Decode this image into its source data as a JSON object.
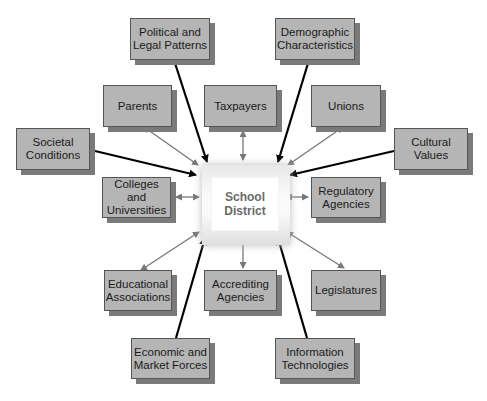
{
  "center": {
    "label_line1": "School",
    "label_line2": "District"
  },
  "nodes": [
    {
      "id": "political",
      "line1": "Political and",
      "line2": "Legal Patterns",
      "link": "one-way"
    },
    {
      "id": "demographic",
      "line1": "Demographic",
      "line2": "Characteristics",
      "link": "one-way"
    },
    {
      "id": "parents",
      "line1": "Parents",
      "line2": "",
      "link": "two-way"
    },
    {
      "id": "taxpayers",
      "line1": "Taxpayers",
      "line2": "",
      "link": "two-way"
    },
    {
      "id": "unions",
      "line1": "Unions",
      "line2": "",
      "link": "two-way"
    },
    {
      "id": "societal",
      "line1": "Societal",
      "line2": "Conditions",
      "link": "one-way"
    },
    {
      "id": "cultural",
      "line1": "Cultural",
      "line2": "Values",
      "link": "one-way"
    },
    {
      "id": "colleges",
      "line1": "Colleges and",
      "line2": "Universities",
      "link": "two-way"
    },
    {
      "id": "regulatory",
      "line1": "Regulatory",
      "line2": "Agencies",
      "link": "two-way"
    },
    {
      "id": "educational",
      "line1": "Educational",
      "line2": "Associations",
      "link": "two-way"
    },
    {
      "id": "accrediting",
      "line1": "Accrediting",
      "line2": "Agencies",
      "link": "two-way"
    },
    {
      "id": "legislatures",
      "line1": "Legislatures",
      "line2": "",
      "link": "two-way"
    },
    {
      "id": "economic",
      "line1": "Economic and",
      "line2": "Market Forces",
      "link": "one-way"
    },
    {
      "id": "information",
      "line1": "Information",
      "line2": "Technologies",
      "link": "one-way"
    }
  ],
  "colors": {
    "box_fill": "#b5b5b5",
    "box_shadow": "#7a7a7a",
    "one_way_arrow": "#000000",
    "two_way_arrow": "#777777",
    "center_text": "#6a6a6a"
  }
}
